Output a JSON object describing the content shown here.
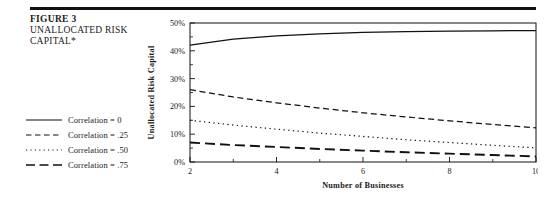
{
  "figure": {
    "title": "FIGURE 3",
    "subtitle_line1": "UNALLOCATED RISK",
    "subtitle_line2": "CAPITAL*",
    "rule_color": "#111111"
  },
  "legend": {
    "position": "left",
    "items": [
      {
        "label": "Correlation = 0",
        "style": "solid",
        "icon": "line-solid-icon"
      },
      {
        "label": "Correlation = .25",
        "style": "dashed",
        "icon": "line-dashed-icon"
      },
      {
        "label": "Correlation = .50",
        "style": "dotted",
        "icon": "line-dotted-icon"
      },
      {
        "label": "Correlation = .75",
        "style": "long-dashed",
        "icon": "line-long-dashed-icon"
      }
    ]
  },
  "chart_data": {
    "type": "line",
    "title": "",
    "xlabel": "Number of Businesses",
    "ylabel": "Unallocated Risk Capital",
    "xlim": [
      2,
      10
    ],
    "ylim": [
      0,
      50
    ],
    "grid": false,
    "x_ticks": [
      2,
      4,
      6,
      8,
      10
    ],
    "x_tick_labels": [
      "2",
      "4",
      "6",
      "8",
      "10"
    ],
    "x_minor_ticks": [
      3,
      5,
      7,
      9
    ],
    "y_ticks": [
      0,
      10,
      20,
      30,
      40,
      50
    ],
    "y_tick_labels": [
      "0%",
      "10%",
      "20%",
      "30%",
      "40%",
      "50%"
    ],
    "y_minor_ticks": [
      5,
      15,
      25,
      35,
      45
    ],
    "x": [
      2,
      3,
      4,
      5,
      6,
      7,
      8,
      9,
      10
    ],
    "series": [
      {
        "name": "Correlation = 0",
        "style": "solid",
        "color": "#111111",
        "values": [
          42.0,
          44.2,
          45.4,
          46.1,
          46.6,
          46.9,
          47.1,
          47.2,
          47.3
        ]
      },
      {
        "name": "Correlation = .25",
        "style": "dashed",
        "color": "#111111",
        "values": [
          26.0,
          23.4,
          21.3,
          19.4,
          17.7,
          16.2,
          14.8,
          13.5,
          12.3
        ]
      },
      {
        "name": "Correlation = .50",
        "style": "dotted",
        "color": "#111111",
        "values": [
          15.0,
          13.3,
          11.8,
          10.4,
          9.2,
          8.0,
          7.0,
          6.0,
          5.1
        ]
      },
      {
        "name": "Correlation = .75",
        "style": "long-dashed",
        "color": "#111111",
        "values": [
          7.0,
          6.1,
          5.4,
          4.7,
          4.1,
          3.5,
          3.0,
          2.5,
          2.0
        ]
      }
    ]
  }
}
